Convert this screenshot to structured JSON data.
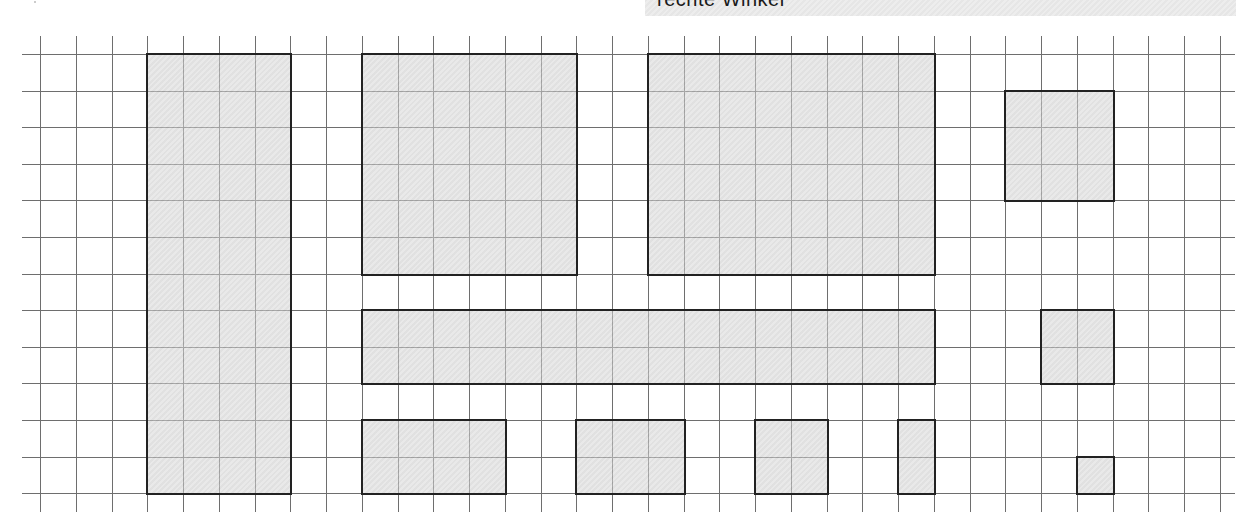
{
  "header": {
    "banner_text": "rechte Winkel"
  },
  "grid": {
    "origin_x": 40,
    "origin_y": 54,
    "cell_w": 35.75,
    "cell_h": 36.6,
    "cols": 33,
    "rows": 12,
    "vline_top": 36,
    "vline_bottom": 512,
    "hline_left": 22,
    "hline_right": 1235,
    "line_color": "#6e6e6e"
  },
  "shapes": [
    {
      "name": "tall-rectangle",
      "col": 3,
      "row": 0,
      "w": 4,
      "h": 12
    },
    {
      "name": "large-square",
      "col": 9,
      "row": 0,
      "w": 6,
      "h": 6
    },
    {
      "name": "large-rectangle",
      "col": 17,
      "row": 0,
      "w": 8,
      "h": 6
    },
    {
      "name": "small-square-top-right",
      "col": 27,
      "row": 1,
      "w": 3,
      "h": 3
    },
    {
      "name": "long-bar",
      "col": 9,
      "row": 7,
      "w": 16,
      "h": 2
    },
    {
      "name": "square-right-middle",
      "col": 28,
      "row": 7,
      "w": 2,
      "h": 2
    },
    {
      "name": "bottom-rectangle-1",
      "col": 9,
      "row": 10,
      "w": 4,
      "h": 2
    },
    {
      "name": "bottom-rectangle-2",
      "col": 15,
      "row": 10,
      "w": 3,
      "h": 2
    },
    {
      "name": "bottom-square-3",
      "col": 20,
      "row": 10,
      "w": 2,
      "h": 2
    },
    {
      "name": "bottom-bar-4",
      "col": 24,
      "row": 10,
      "w": 1,
      "h": 2
    },
    {
      "name": "tiny-square",
      "col": 29,
      "row": 11,
      "w": 1,
      "h": 1
    }
  ]
}
